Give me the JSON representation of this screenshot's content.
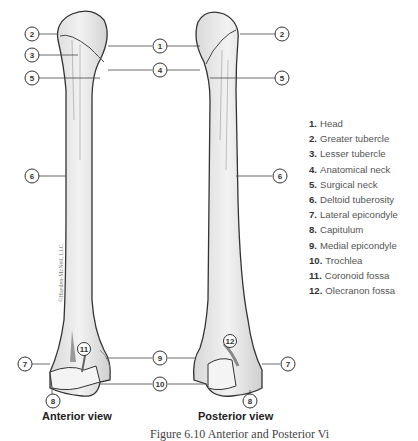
{
  "views": {
    "anterior": {
      "label": "Anterior view"
    },
    "posterior": {
      "label": "Posterior view"
    }
  },
  "legend": [
    {
      "num": "1.",
      "text": "Head"
    },
    {
      "num": "2.",
      "text": "Greater tubercle"
    },
    {
      "num": "3.",
      "text": "Lesser tubercle"
    },
    {
      "num": "4.",
      "text": "Anatomical neck"
    },
    {
      "num": "5.",
      "text": "Surgical neck"
    },
    {
      "num": "6.",
      "text": "Deltoid tuberosity"
    },
    {
      "num": "7.",
      "text": "Lateral epicondyle"
    },
    {
      "num": "8.",
      "text": "Capitulum"
    },
    {
      "num": "9.",
      "text": "Medial epicondyle"
    },
    {
      "num": "10.",
      "text": "Trochlea"
    },
    {
      "num": "11.",
      "text": "Coronoid fossa"
    },
    {
      "num": "12.",
      "text": "Olecranon fossa"
    }
  ],
  "callouts": {
    "c1": "1",
    "c2a": "2",
    "c2b": "2",
    "c3": "3",
    "c4": "4",
    "c5a": "5",
    "c5b": "5",
    "c6a": "6",
    "c6b": "6",
    "c7a": "7",
    "c7b": "7",
    "c8a": "8",
    "c8b": "8",
    "c9": "9",
    "c10": "10",
    "c11": "11",
    "c12": "12"
  },
  "watermark": "©Hayden-McNeil, LLC",
  "caption": "Figure 6.10 Anterior and Posterior Vi"
}
